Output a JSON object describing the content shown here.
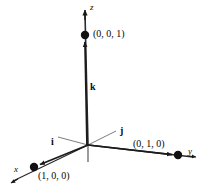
{
  "figure": {
    "background_color": "#ffffff",
    "stroke_color": "#1a1a1a",
    "text_color": "#0a0a0a",
    "origin": {
      "x": 88,
      "y": 145
    }
  },
  "axes": [
    {
      "name": "x-axis",
      "label": "x",
      "label_style": "italic",
      "label_x": 14,
      "label_y": 166,
      "tip": {
        "x": 11,
        "y": 183
      },
      "direction": "lower-left"
    },
    {
      "name": "y-axis",
      "label": "y",
      "label_style": "italic",
      "label_x": 188,
      "label_y": 148,
      "tip": {
        "x": 197,
        "y": 157
      },
      "direction": "right"
    },
    {
      "name": "z-axis",
      "label": "z",
      "label_style": "italic",
      "label_x": 90,
      "label_y": 4,
      "tip": {
        "x": 85,
        "y": 7
      },
      "direction": "up"
    }
  ],
  "vectors": [
    {
      "name": "i",
      "label": "i",
      "label_x": 51,
      "label_y": 138,
      "points_to": "(1, 0, 0)"
    },
    {
      "name": "j",
      "label": "j",
      "label_x": 120,
      "label_y": 127,
      "points_to": "(0, 1, 0)"
    },
    {
      "name": "k",
      "label": "k",
      "label_x": 90,
      "label_y": 83,
      "points_to": "(0, 0, 1)"
    }
  ],
  "points": [
    {
      "name": "point-1-0-0",
      "label": "(1, 0, 0)",
      "dot_x": 34,
      "dot_y": 167,
      "label_x": 38,
      "label_y": 172
    },
    {
      "name": "point-0-1-0",
      "label": "(0, 1, 0)",
      "dot_x": 178,
      "dot_y": 155,
      "label_x": 133,
      "label_y": 140
    },
    {
      "name": "point-0-0-1",
      "label": "(0, 0, 1)",
      "dot_x": 85,
      "dot_y": 35,
      "label_x": 93,
      "label_y": 29
    }
  ]
}
